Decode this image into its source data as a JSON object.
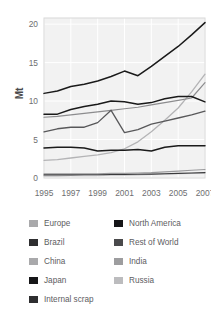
{
  "chart_data": {
    "type": "line",
    "title": "",
    "xlabel": "",
    "ylabel": "Mt",
    "x": [
      1995,
      1996,
      1997,
      1998,
      1999,
      2000,
      2001,
      2002,
      2003,
      2004,
      2005,
      2006,
      2007
    ],
    "xtick_labels": [
      "1995",
      "1997",
      "1999",
      "2001",
      "2003",
      "2005",
      "2007"
    ],
    "xticks": [
      1995,
      1997,
      1999,
      2001,
      2003,
      2005,
      2007
    ],
    "ytick_labels": [
      "0",
      "5",
      "10",
      "15",
      "20"
    ],
    "yticks": [
      0,
      5,
      10,
      15,
      20
    ],
    "xlim": [
      1995,
      2007
    ],
    "ylim": [
      0,
      20.8
    ],
    "grid": true,
    "legend_position": "bottom",
    "series": [
      {
        "name": "China",
        "color": "#1a1a1a",
        "width": 1.5,
        "values": [
          11.0,
          11.3,
          11.9,
          12.2,
          12.6,
          13.2,
          13.9,
          13.3,
          14.5,
          15.8,
          17.1,
          18.6,
          20.2
        ]
      },
      {
        "name": "Japan",
        "color": "#1a1a1a",
        "width": 1.5,
        "values": [
          8.3,
          8.3,
          8.9,
          9.3,
          9.6,
          10.0,
          9.9,
          9.6,
          9.8,
          10.3,
          10.6,
          10.6,
          9.9
        ]
      },
      {
        "name": "Rest of World",
        "color": "#58585a",
        "width": 1.3,
        "values": [
          6.0,
          6.4,
          6.6,
          6.6,
          7.2,
          8.8,
          5.9,
          6.3,
          7.0,
          7.4,
          7.8,
          8.2,
          8.7
        ]
      },
      {
        "name": "Europe",
        "color": "#8c8c8e",
        "width": 1.2,
        "values": [
          7.9,
          8.0,
          8.2,
          8.4,
          8.6,
          8.8,
          9.0,
          9.2,
          9.5,
          9.8,
          10.1,
          10.4,
          12.4
        ]
      },
      {
        "name": "North America",
        "color": "#1a1a1a",
        "width": 1.5,
        "values": [
          3.9,
          4.0,
          4.0,
          3.9,
          3.5,
          3.6,
          3.6,
          3.7,
          3.5,
          4.0,
          4.2,
          4.2,
          4.2
        ]
      },
      {
        "name": "Brazil",
        "color": "#b4b4b6",
        "width": 1.3,
        "values": [
          2.3,
          2.4,
          2.6,
          2.8,
          3.0,
          3.3,
          3.8,
          4.7,
          6.0,
          7.5,
          9.1,
          11.2,
          13.5
        ]
      },
      {
        "name": "India",
        "color": "#9a9a9c",
        "width": 1.1,
        "values": [
          0.55,
          0.55,
          0.55,
          0.55,
          0.55,
          0.6,
          0.6,
          0.65,
          0.7,
          0.8,
          0.9,
          1.0,
          1.1
        ]
      },
      {
        "name": "Russia",
        "color": "#c4c4c6",
        "width": 1.1,
        "values": [
          0.25,
          0.25,
          0.3,
          0.3,
          0.3,
          0.35,
          0.35,
          0.4,
          0.45,
          0.5,
          0.55,
          0.6,
          0.65
        ]
      },
      {
        "name": "Internal scrap",
        "color": "#3a3a3c",
        "width": 1.1,
        "values": [
          0.4,
          0.4,
          0.4,
          0.42,
          0.42,
          0.45,
          0.45,
          0.48,
          0.5,
          0.55,
          0.6,
          0.65,
          0.7
        ]
      }
    ]
  },
  "legend": {
    "left_column": [
      {
        "label": "Europe",
        "color": "#a9a9ab"
      },
      {
        "label": "Brazil",
        "color": "#2e2e30"
      },
      {
        "label": "China",
        "color": "#a9a9ab"
      },
      {
        "label": "Japan",
        "color": "#161618"
      },
      {
        "label": "Internal scrap",
        "color": "#2e2e30"
      }
    ],
    "right_column": [
      {
        "label": "North America",
        "color": "#161618"
      },
      {
        "label": "Rest of World",
        "color": "#4a4a4c"
      },
      {
        "label": "India",
        "color": "#9d9d9f"
      },
      {
        "label": "Russia",
        "color": "#bcbcbe"
      }
    ]
  }
}
